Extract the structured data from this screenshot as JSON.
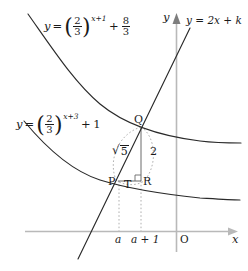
{
  "figure": {
    "type": "math-diagram"
  },
  "axes": {
    "x_label": "x",
    "y_label": "y",
    "origin_label": "O",
    "x_ticks": [
      {
        "label": "a"
      },
      {
        "label": "a + 1"
      }
    ],
    "axis_color": "#b9b9b9"
  },
  "curves": {
    "upper": {
      "label_parts": {
        "lhs": "y",
        "eq": "=",
        "base_num": "2",
        "base_den": "3",
        "exponent": "x+1",
        "plus": "+",
        "add_num": "8",
        "add_den": "3"
      },
      "equation_text": "y = (2/3)^(x+1) + 8/3",
      "color": "#2a2a2a"
    },
    "lower": {
      "label_parts": {
        "lhs": "y",
        "eq": "=",
        "base_num": "2",
        "base_den": "3",
        "exponent": "x+3",
        "plus": "+",
        "add_const": "1"
      },
      "equation_text": "y = (2/3)^(x+3) + 1",
      "color": "#2a2a2a"
    }
  },
  "line": {
    "label": "y = 2x + k",
    "color": "#2a2a2a"
  },
  "points": {
    "P": "P",
    "Q": "Q",
    "R": "R",
    "T": "T"
  },
  "measures": {
    "hypotenuse_sym": "√",
    "hypotenuse_value": "5",
    "hypotenuse_text": "√5",
    "vertical_leg": "2"
  },
  "colors": {
    "ink": "#1a1a1a",
    "curve": "#2a2a2a",
    "axis": "#b9b9b9",
    "dotted": "#9a9a9a"
  }
}
